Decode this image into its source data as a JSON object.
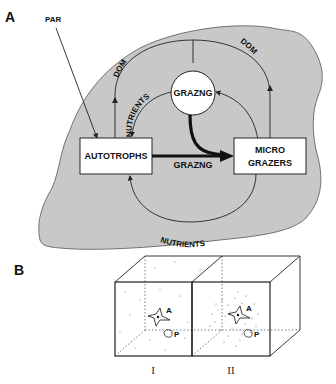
{
  "panel_a": {
    "label": "A",
    "input_label": "PAR",
    "nodes": {
      "autotrophs": "AUTOTROPHS",
      "micro_grazers_line1": "MICRO",
      "micro_grazers_line2": "GRAZERS",
      "grazing_circle": "GRAZNG"
    },
    "flows": {
      "grazing_arrow": "GRAZNG",
      "dom_left": "DOM",
      "dom_right": "DOM",
      "nutrients_upper": "NUTRIENTS",
      "nutrients_lower": "NUTRIENTS"
    },
    "colors": {
      "background_blob": "#c8c8c8",
      "box_fill": "#ffffff",
      "line": "#222222"
    }
  },
  "panel_b": {
    "label": "B",
    "cubes": [
      {
        "id": "I",
        "roman": "I",
        "organism_a": "A",
        "organism_p": "P"
      },
      {
        "id": "II",
        "roman": "II",
        "organism_a": "A",
        "organism_p": "P"
      }
    ]
  }
}
